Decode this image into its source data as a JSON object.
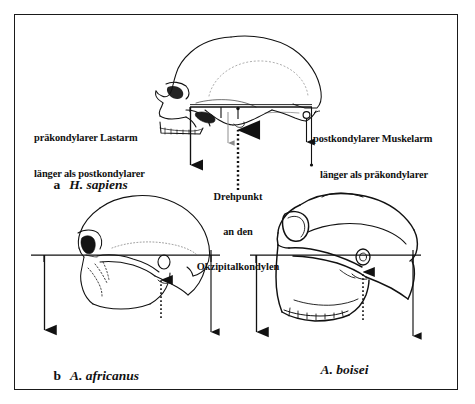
{
  "figure": {
    "caption_language": "German",
    "frame": {
      "border_color": "#1a1a1a"
    },
    "ink_color": "#111111",
    "panels": [
      {
        "id": "a",
        "letter": "a",
        "species": "H. sapiens",
        "skull_orientation": "left-facing",
        "lever_line_y": 107
      },
      {
        "id": "b",
        "letter": "b",
        "species": "A. africanus",
        "skull_orientation": "left-facing",
        "lever_line_y": 255
      },
      {
        "id": "c",
        "letter": "",
        "species": "A. boisei",
        "skull_orientation": "left-facing",
        "lever_line_y": 255
      }
    ],
    "annotations": {
      "left_label": {
        "line1": "präkondylarer Lastarm",
        "line2": "länger als postkondylarer"
      },
      "right_label": {
        "line1": "postkondylarer Muskelarm",
        "line2": "länger als präkondylarer"
      },
      "center_label": {
        "line1": "Drehpunkt",
        "line2": "an den",
        "line3": "Okzipitalkondylen"
      }
    },
    "markers": {
      "fulcrum_circle": "occipital-condyle-pivot",
      "load_arrow": "downward-load-arrow",
      "muscle_arrow": "downward-muscle-force-arrow",
      "reaction_arrow": "upward-reaction-arrow-dotted"
    }
  }
}
